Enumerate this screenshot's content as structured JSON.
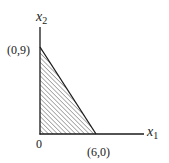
{
  "diagram": {
    "type": "feasible-region",
    "axes": {
      "x_label": "x",
      "x_sub": "1",
      "y_label": "x",
      "y_sub": "2",
      "origin_label": "0"
    },
    "vertices": [
      {
        "label": "(0,9)",
        "x": 0,
        "y": 9
      },
      {
        "label": "(6,0)",
        "x": 6,
        "y": 0
      },
      {
        "label": "0",
        "x": 0,
        "y": 0
      }
    ],
    "region": {
      "shape": "triangle",
      "fill": "hatched",
      "hatch_direction": "diagonal-up-right"
    },
    "colors": {
      "line": "#1a1a1a",
      "hatch": "#3a3a3a",
      "background": "#ffffff"
    }
  }
}
